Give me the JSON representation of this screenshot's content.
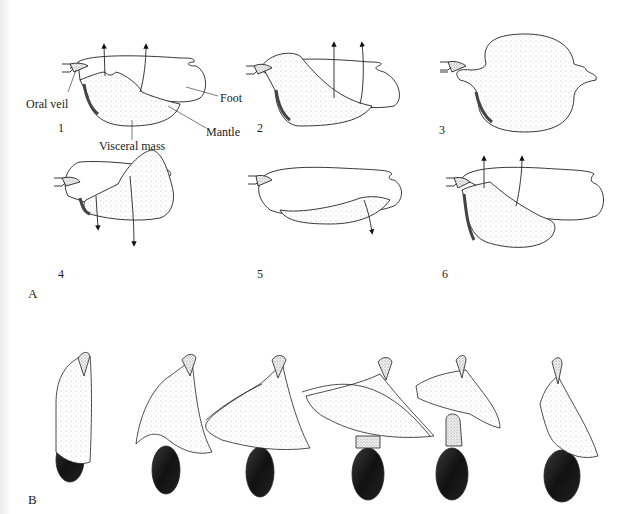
{
  "figure": {
    "panel_a": {
      "label": "A",
      "stages": [
        {
          "number": "1"
        },
        {
          "number": "2"
        },
        {
          "number": "3"
        },
        {
          "number": "4"
        },
        {
          "number": "5"
        },
        {
          "number": "6"
        }
      ],
      "annotations": {
        "oral_veil": "Oral veil",
        "foot": "Foot",
        "mantle": "Mantle",
        "visceral_mass": "Visceral mass"
      }
    },
    "panel_b": {
      "label": "B",
      "stage_count": 6
    }
  },
  "colors": {
    "ink": "#222222",
    "stipple": "#9a9a9a",
    "shell": "#1e1e1e",
    "paper": "#ffffff"
  }
}
